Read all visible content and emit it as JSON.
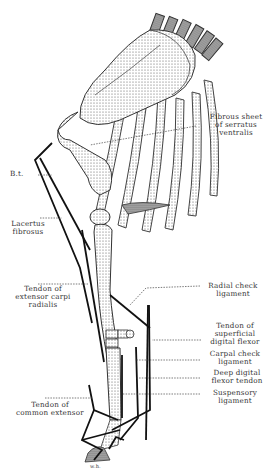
{
  "diagram": {
    "signature": "w.h.",
    "labels": [
      {
        "id": "fibrous-sheet",
        "lines": [
          "Fibrous sheet",
          "of serratus",
          "ventralis"
        ]
      },
      {
        "id": "bt",
        "lines": [
          "B.t."
        ]
      },
      {
        "id": "lacertus",
        "lines": [
          "Lacertus",
          "fibrosus"
        ]
      },
      {
        "id": "ext-carpi",
        "lines": [
          "Tendon of",
          "extensor carpi",
          "radialis"
        ]
      },
      {
        "id": "radial-check",
        "lines": [
          "Radial check",
          "ligament"
        ]
      },
      {
        "id": "superficial-flexor",
        "lines": [
          "Tendon of",
          "superficial",
          "digital flexor"
        ]
      },
      {
        "id": "carpal-check",
        "lines": [
          "Carpal check",
          "ligament"
        ]
      },
      {
        "id": "deep-flexor",
        "lines": [
          "Deep digital",
          "flexor tendon"
        ]
      },
      {
        "id": "suspensory",
        "lines": [
          "Suspensory",
          "ligament"
        ]
      },
      {
        "id": "common-extensor",
        "lines": [
          "Tendon of",
          "common extensor"
        ]
      }
    ]
  }
}
